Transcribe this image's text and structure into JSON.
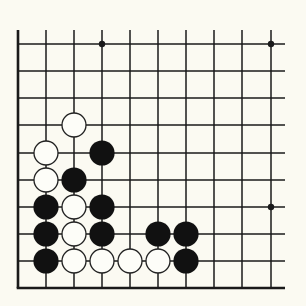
{
  "diagram": {
    "type": "go-board-fragment",
    "corner": "bottom-left",
    "colors": {
      "background": "#fbfaf2",
      "line": "#1a1a1a",
      "black_stone": "#111111",
      "white_stone_fill": "#fdfdf8",
      "white_stone_stroke": "#222222"
    },
    "grid": {
      "columns_x": [
        18,
        46,
        74,
        102,
        130,
        158,
        186,
        214,
        242,
        271
      ],
      "rows_y": [
        44,
        71,
        98,
        125,
        153,
        180,
        207,
        234,
        261,
        288
      ],
      "line_extent": {
        "top": 30,
        "right": 285
      },
      "edges": [
        "left",
        "bottom"
      ]
    },
    "star_points": [
      {
        "col": 3,
        "row": 0
      },
      {
        "col": 9,
        "row": 0
      },
      {
        "col": 9,
        "row": 6
      }
    ],
    "stones": [
      {
        "color": "white",
        "col": 2,
        "row": 3
      },
      {
        "color": "white",
        "col": 1,
        "row": 4
      },
      {
        "color": "black",
        "col": 3,
        "row": 4
      },
      {
        "color": "white",
        "col": 1,
        "row": 5
      },
      {
        "color": "black",
        "col": 2,
        "row": 5
      },
      {
        "color": "black",
        "col": 1,
        "row": 6
      },
      {
        "color": "white",
        "col": 2,
        "row": 6
      },
      {
        "color": "black",
        "col": 3,
        "row": 6
      },
      {
        "color": "black",
        "col": 1,
        "row": 7
      },
      {
        "color": "white",
        "col": 2,
        "row": 7
      },
      {
        "color": "black",
        "col": 3,
        "row": 7
      },
      {
        "color": "black",
        "col": 5,
        "row": 7
      },
      {
        "color": "black",
        "col": 6,
        "row": 7
      },
      {
        "color": "black",
        "col": 1,
        "row": 8
      },
      {
        "color": "white",
        "col": 2,
        "row": 8
      },
      {
        "color": "white",
        "col": 3,
        "row": 8
      },
      {
        "color": "white",
        "col": 4,
        "row": 8
      },
      {
        "color": "white",
        "col": 5,
        "row": 8
      },
      {
        "color": "black",
        "col": 6,
        "row": 8
      }
    ]
  }
}
